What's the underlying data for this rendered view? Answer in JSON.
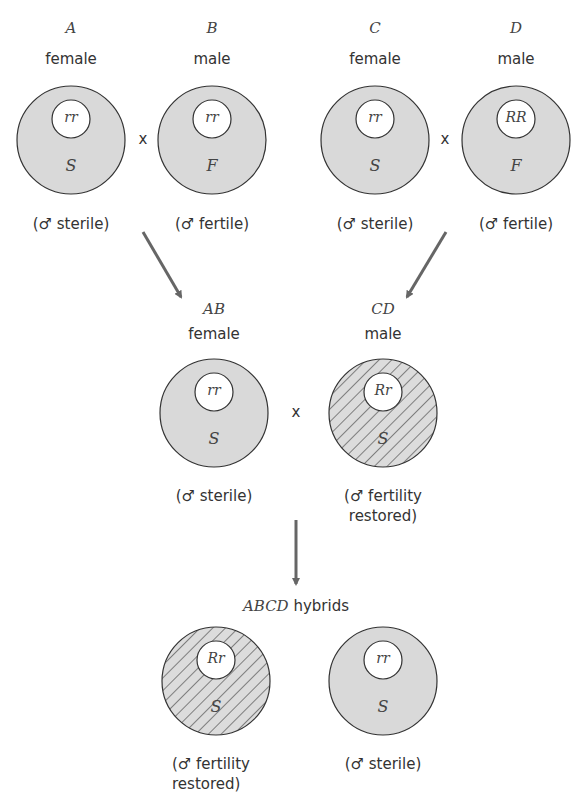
{
  "colors": {
    "fill": "#d9d9d9",
    "stroke": "#333333",
    "arrow": "#666666",
    "inner": "#ffffff"
  },
  "parents": [
    {
      "id": "A",
      "letter": "A",
      "sex": "female",
      "genotype": "rr",
      "cytoplasm": "S",
      "note": "(♂ sterile)",
      "pattern": "stipple"
    },
    {
      "id": "B",
      "letter": "B",
      "sex": "male",
      "genotype": "rr",
      "cytoplasm": "F",
      "note": "(♂ fertile)",
      "pattern": "stipple"
    },
    {
      "id": "C",
      "letter": "C",
      "sex": "female",
      "genotype": "rr",
      "cytoplasm": "S",
      "note": "(♂ sterile)",
      "pattern": "stipple"
    },
    {
      "id": "D",
      "letter": "D",
      "sex": "male",
      "genotype": "RR",
      "cytoplasm": "F",
      "note": "(♂ fertile)",
      "pattern": "stipple"
    }
  ],
  "cross_symbol": "x",
  "f1": [
    {
      "id": "AB",
      "letter": "AB",
      "sex": "female",
      "genotype": "rr",
      "cytoplasm": "S",
      "note": "(♂ sterile)",
      "pattern": "stipple"
    },
    {
      "id": "CD",
      "letter": "CD",
      "sex": "male",
      "genotype": "Rr",
      "cytoplasm": "S",
      "note_line1": "(♂ fertility",
      "note_line2": "restored)",
      "pattern": "hatch"
    }
  ],
  "hybrids": {
    "title_italic": "ABCD",
    "title_rest": " hybrids",
    "items": [
      {
        "genotype": "Rr",
        "cytoplasm": "S",
        "note_line1": "(♂ fertility",
        "note_line2": "restored)",
        "pattern": "hatch"
      },
      {
        "genotype": "rr",
        "cytoplasm": "S",
        "note": "(♂ sterile)",
        "pattern": "stipple"
      }
    ]
  }
}
